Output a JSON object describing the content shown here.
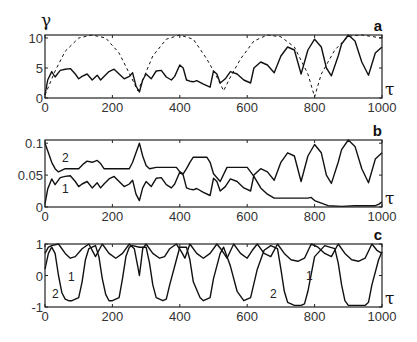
{
  "figure": {
    "x_symbol": "τ",
    "y_symbol_a": "γ"
  },
  "chart_data": [
    {
      "type": "line",
      "panel": "a",
      "title": "a",
      "xlabel": "τ",
      "ylabel": "γ",
      "xlim": [
        0,
        1000
      ],
      "ylim": [
        0,
        10.5
      ],
      "xticks": [
        0,
        200,
        400,
        600,
        800,
        1000
      ],
      "yticks": [
        0,
        5,
        10
      ],
      "xtick_labels": [
        "0",
        "200",
        "400",
        "600",
        "800",
        "1000"
      ],
      "ytick_labels": [
        "0",
        "5",
        "10"
      ],
      "grid": false,
      "series": [
        {
          "name": "solid",
          "style": "solid",
          "x": [
            0,
            8,
            20,
            30,
            45,
            60,
            75,
            90,
            100,
            110,
            125,
            140,
            155,
            165,
            175,
            190,
            205,
            220,
            235,
            250,
            260,
            270,
            280,
            290,
            300,
            315,
            330,
            345,
            360,
            375,
            385,
            400,
            410,
            420,
            430,
            440,
            450,
            470,
            490,
            500,
            510,
            520,
            535,
            550,
            570,
            590,
            610,
            620,
            640,
            660,
            680,
            700,
            720,
            740,
            760,
            780,
            800,
            820,
            835,
            850,
            870,
            880,
            900,
            920,
            940,
            960,
            980,
            1000
          ],
          "y": [
            0.5,
            3.0,
            4.4,
            3.5,
            4.6,
            4.8,
            4.9,
            4.0,
            3.2,
            3.6,
            4.0,
            3.0,
            3.8,
            3.0,
            3.6,
            4.4,
            4.8,
            4.0,
            3.2,
            3.6,
            4.2,
            2.0,
            1.0,
            3.0,
            4.0,
            3.2,
            4.5,
            4.6,
            3.5,
            3.0,
            3.6,
            5.5,
            5.0,
            3.0,
            2.8,
            2.7,
            2.9,
            2.3,
            1.8,
            4.5,
            4.0,
            2.5,
            3.2,
            4.4,
            4.0,
            3.0,
            2.5,
            5.0,
            6.0,
            5.5,
            4.2,
            7.0,
            8.5,
            8.0,
            4.0,
            8.0,
            9.8,
            8.5,
            5.0,
            3.7,
            7.0,
            9.0,
            10.5,
            9.5,
            6.0,
            3.8,
            7.5,
            8.5
          ]
        },
        {
          "name": "dashed",
          "style": "dashed",
          "x": [
            0,
            30,
            60,
            100,
            140,
            180,
            220,
            260,
            275,
            290,
            320,
            360,
            400,
            440,
            480,
            510,
            530,
            550,
            580,
            620,
            660,
            700,
            740,
            780,
            800,
            820,
            860,
            900,
            940,
            1000
          ],
          "y": [
            0.5,
            4.5,
            7.8,
            10.0,
            10.5,
            10.0,
            7.5,
            3.0,
            1.2,
            3.0,
            7.0,
            9.8,
            10.5,
            9.8,
            6.5,
            3.5,
            1.2,
            3.5,
            6.5,
            9.5,
            10.5,
            10.2,
            8.5,
            4.0,
            0.2,
            4.0,
            8.0,
            10.3,
            10.5,
            10.0
          ]
        }
      ]
    },
    {
      "type": "line",
      "panel": "b",
      "title": "b",
      "xlabel": "τ",
      "ylabel": "",
      "xlim": [
        0,
        1000
      ],
      "ylim": [
        0,
        0.105
      ],
      "xticks": [
        0,
        200,
        400,
        600,
        800,
        1000
      ],
      "yticks": [
        0,
        0.05,
        0.1
      ],
      "xtick_labels": [
        "0",
        "200",
        "400",
        "600",
        "800",
        "1000"
      ],
      "ytick_labels": [
        "0",
        "0.05",
        "0.1"
      ],
      "grid": false,
      "annotations": [
        "1",
        "2"
      ],
      "series": [
        {
          "name": "1",
          "x": [
            0,
            8,
            20,
            30,
            45,
            60,
            75,
            90,
            100,
            110,
            125,
            140,
            155,
            165,
            175,
            190,
            205,
            220,
            235,
            250,
            260,
            270,
            280,
            290,
            300,
            315,
            330,
            345,
            360,
            375,
            385,
            400,
            410,
            420,
            430,
            440,
            450,
            470,
            490,
            500,
            510,
            520,
            535,
            550,
            570,
            590,
            610,
            620,
            640,
            660,
            680,
            700,
            720,
            740,
            760,
            780,
            800,
            820,
            835,
            850,
            870,
            880,
            900,
            920,
            940,
            960,
            980,
            1000
          ],
          "y": [
            0.005,
            0.028,
            0.044,
            0.035,
            0.046,
            0.048,
            0.049,
            0.04,
            0.032,
            0.036,
            0.04,
            0.03,
            0.038,
            0.03,
            0.036,
            0.044,
            0.048,
            0.04,
            0.032,
            0.036,
            0.042,
            0.02,
            0.01,
            0.03,
            0.04,
            0.032,
            0.045,
            0.046,
            0.035,
            0.03,
            0.036,
            0.055,
            0.05,
            0.03,
            0.028,
            0.027,
            0.029,
            0.023,
            0.018,
            0.045,
            0.04,
            0.025,
            0.032,
            0.044,
            0.04,
            0.03,
            0.025,
            0.05,
            0.06,
            0.055,
            0.042,
            0.07,
            0.085,
            0.08,
            0.04,
            0.08,
            0.098,
            0.085,
            0.05,
            0.037,
            0.07,
            0.09,
            0.105,
            0.095,
            0.06,
            0.038,
            0.075,
            0.085
          ]
        },
        {
          "name": "2",
          "x": [
            0,
            10,
            20,
            30,
            40,
            60,
            80,
            100,
            115,
            125,
            140,
            155,
            165,
            175,
            200,
            230,
            250,
            260,
            270,
            280,
            290,
            300,
            310,
            330,
            360,
            390,
            400,
            410,
            420,
            430,
            440,
            460,
            480,
            490,
            500,
            520,
            540,
            560,
            580,
            600,
            610,
            620,
            640,
            660,
            680,
            700,
            750,
            780,
            790,
            800,
            820,
            840,
            880,
            920,
            960,
            980,
            990,
            1000
          ],
          "y": [
            0.1,
            0.085,
            0.07,
            0.06,
            0.055,
            0.06,
            0.06,
            0.06,
            0.068,
            0.072,
            0.07,
            0.073,
            0.068,
            0.06,
            0.06,
            0.06,
            0.06,
            0.07,
            0.085,
            0.1,
            0.08,
            0.065,
            0.06,
            0.062,
            0.062,
            0.062,
            0.055,
            0.052,
            0.06,
            0.07,
            0.078,
            0.078,
            0.078,
            0.07,
            0.052,
            0.04,
            0.062,
            0.062,
            0.062,
            0.062,
            0.055,
            0.048,
            0.03,
            0.02,
            0.014,
            0.014,
            0.014,
            0.014,
            0.015,
            0.01,
            0.006,
            0.002,
            0.001,
            0.002,
            0.002,
            0.002,
            0.004,
            0.008
          ]
        }
      ]
    },
    {
      "type": "line",
      "panel": "c",
      "title": "c",
      "xlabel": "τ",
      "ylabel": "",
      "xlim": [
        0,
        1000
      ],
      "ylim": [
        -1,
        1
      ],
      "xticks": [
        0,
        200,
        400,
        600,
        800,
        1000
      ],
      "yticks": [
        -1,
        0,
        1
      ],
      "xtick_labels": [
        "0",
        "200",
        "400",
        "600",
        "800",
        "1000"
      ],
      "ytick_labels": [
        "-1",
        "0",
        "1"
      ],
      "grid": false,
      "annotations": [
        "1",
        "2"
      ],
      "series": [
        {
          "name": "1",
          "x": [
            0,
            10,
            20,
            40,
            60,
            75,
            90,
            110,
            130,
            140,
            150,
            170,
            190,
            210,
            230,
            250,
            265,
            275,
            280,
            285,
            290,
            300,
            320,
            340,
            355,
            370,
            390,
            405,
            415,
            430,
            450,
            470,
            490,
            510,
            525,
            540,
            560,
            580,
            600,
            615,
            630,
            650,
            670,
            690,
            710,
            730,
            750,
            770,
            790,
            810,
            830,
            850,
            870,
            890,
            910,
            930,
            950,
            970,
            985,
            1000
          ],
          "y": [
            0.7,
            0.9,
            0.95,
            1.0,
            0.7,
            0.55,
            0.6,
            0.85,
            1.0,
            0.8,
            0.6,
            1.0,
            0.7,
            0.55,
            0.7,
            1.0,
            0.85,
            0.3,
            0.0,
            0.4,
            0.85,
            1.0,
            0.7,
            0.55,
            0.6,
            0.85,
            1.0,
            0.75,
            0.55,
            1.0,
            0.7,
            0.55,
            0.7,
            1.0,
            0.8,
            0.55,
            1.0,
            0.7,
            0.55,
            0.8,
            1.0,
            0.7,
            0.6,
            1.0,
            0.7,
            0.5,
            0.45,
            0.55,
            1.0,
            0.9,
            0.7,
            0.6,
            1.0,
            0.7,
            0.5,
            0.45,
            0.55,
            1.0,
            0.8,
            0.7
          ]
        },
        {
          "name": "2",
          "x": [
            0,
            10,
            20,
            30,
            40,
            50,
            60,
            70,
            80,
            100,
            110,
            120,
            130,
            150,
            160,
            170,
            180,
            190,
            200,
            220,
            230,
            240,
            250,
            260,
            280,
            300,
            310,
            320,
            330,
            350,
            360,
            370,
            390,
            400,
            420,
            430,
            440,
            460,
            470,
            490,
            500,
            520,
            530,
            550,
            570,
            590,
            610,
            630,
            650,
            670,
            690,
            700,
            710,
            720,
            740,
            760,
            770,
            780,
            800,
            830,
            860,
            870,
            880,
            890,
            900,
            930,
            950,
            960,
            970,
            990,
            1000
          ],
          "y": [
            0.2,
            0.7,
            0.9,
            0.7,
            0.0,
            -0.55,
            -0.75,
            -0.8,
            -0.8,
            -0.7,
            -0.2,
            0.5,
            0.85,
            0.95,
            0.6,
            -0.1,
            -0.6,
            -0.8,
            -0.8,
            -0.7,
            -0.1,
            0.6,
            0.9,
            0.95,
            0.9,
            0.9,
            0.4,
            -0.3,
            -0.7,
            -0.8,
            -0.75,
            -0.3,
            0.5,
            0.9,
            0.9,
            0.5,
            -0.2,
            -0.7,
            -0.8,
            -0.7,
            -0.1,
            0.7,
            0.9,
            0.3,
            -0.5,
            -0.8,
            -0.7,
            0.2,
            0.8,
            0.95,
            0.85,
            0.2,
            -0.5,
            -0.85,
            -0.95,
            -0.95,
            -0.9,
            -0.5,
            0.6,
            0.95,
            0.85,
            0.4,
            -0.3,
            -0.8,
            -0.95,
            -0.95,
            -0.95,
            -0.85,
            -0.3,
            0.5,
            0.75
          ]
        }
      ]
    }
  ]
}
